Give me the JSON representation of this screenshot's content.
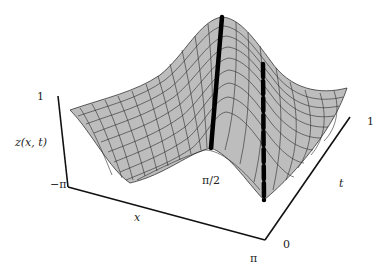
{
  "figure": {
    "type": "3d-surface-plot",
    "surface_fill": "#bdbdbd",
    "mesh_color": "#2a2a2a",
    "axis_color": "#111111"
  },
  "axes": {
    "z_label": "z(x, t)",
    "z_tick_left": "1",
    "z_tick_right": "1",
    "x_label": "x",
    "x_tick_min": "−π",
    "x_tick_max": "π",
    "x_tick_mid": "π/2",
    "t_label": "t",
    "t_tick_min": "0"
  },
  "annotations": {
    "solid_line": "thick solid vertical line at x = π/2",
    "dashed_line": "thick dashed line across surface"
  }
}
